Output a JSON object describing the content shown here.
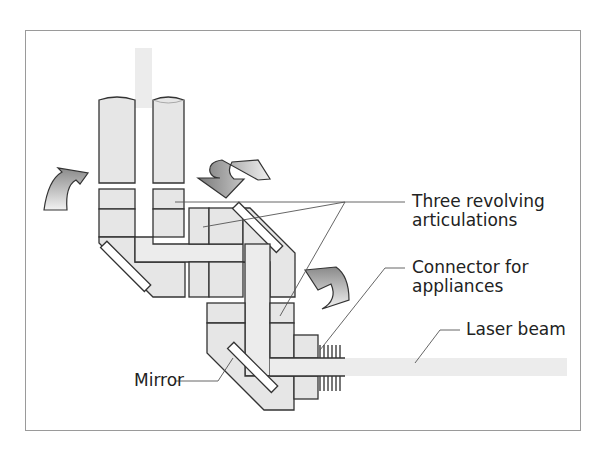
{
  "figure": {
    "type": "articulated arm diagram",
    "labels": {
      "articulations_line1": "Three revolving",
      "articulations_line2": "articulations",
      "connector_line1": "Connector for",
      "connector_line2": "appliances",
      "laser_beam": "Laser beam",
      "mirror": "Mirror"
    },
    "colors": {
      "part_fill": "#e6e6e6",
      "beam_fill": "#ececec",
      "outline": "#333333",
      "leader": "#555555",
      "frame": "#9a9a9a"
    },
    "icons": [
      "rotation-arrow-icon",
      "rotation-arrow-icon",
      "rotation-arrow-icon"
    ]
  }
}
